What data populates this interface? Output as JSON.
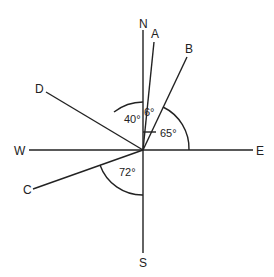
{
  "diagram": {
    "type": "compass bearings",
    "center": {
      "x": 143,
      "y": 150
    },
    "directions": [
      {
        "id": "N",
        "label": "N"
      },
      {
        "id": "S",
        "label": "S"
      },
      {
        "id": "E",
        "label": "E"
      },
      {
        "id": "W",
        "label": "W"
      }
    ],
    "points": [
      {
        "id": "A",
        "label": "A"
      },
      {
        "id": "B",
        "label": "B"
      },
      {
        "id": "C",
        "label": "C"
      },
      {
        "id": "D",
        "label": "D"
      }
    ],
    "angles": [
      {
        "id": "NA",
        "label": "6°",
        "between": "N and A"
      },
      {
        "id": "DN",
        "label": "40°",
        "between": "D and N"
      },
      {
        "id": "BE",
        "label": "65°",
        "between": "B and E"
      },
      {
        "id": "CS",
        "label": "72°",
        "between": "C and S"
      }
    ]
  }
}
